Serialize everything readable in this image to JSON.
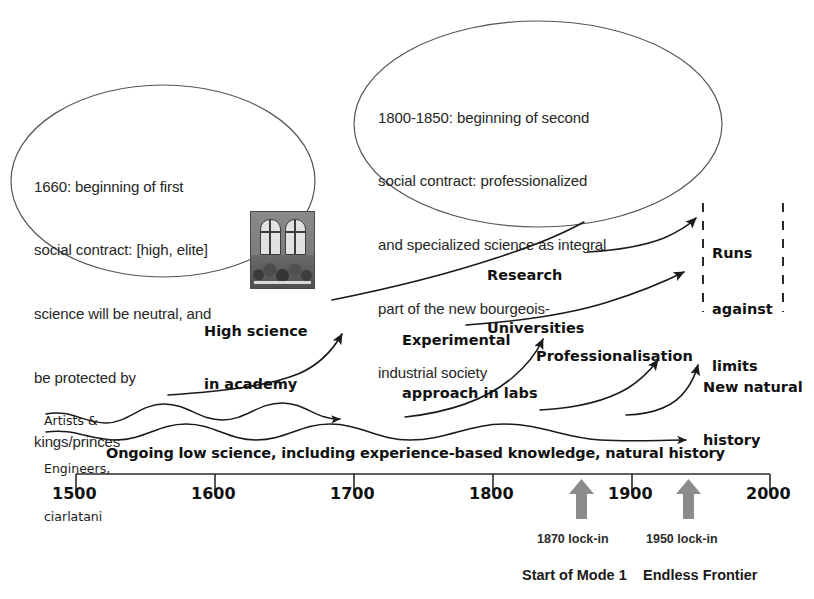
{
  "figure": {
    "type": "diagram"
  },
  "callouts": [
    {
      "id": "first-social-contract",
      "lines": [
        "1660: beginning of first",
        "social contract: [high, elite]",
        "science will be neutral, and",
        "be protected by",
        "kings/princes"
      ]
    },
    {
      "id": "second-social-contract",
      "lines": [
        "1800-1850: beginning of second",
        "social contract: professionalized",
        "and specialized science as integral",
        "part of the new bourgeois-",
        "industrial society"
      ]
    }
  ],
  "labels": {
    "artists": [
      "Artists &",
      "Engineers,",
      "ciarlatani"
    ],
    "high_science": [
      "High science",
      "in academy"
    ],
    "experimental": [
      "Experimental",
      "approach in labs"
    ],
    "research_universities": [
      "Research",
      "Universities"
    ],
    "professionalisation": "Professionalisation",
    "new_natural_history": [
      "New natural",
      "history"
    ],
    "runs_against_limits": [
      "Runs",
      "against",
      "limits"
    ],
    "ongoing_band": "Ongoing low science, including experience-based knowledge, natural history"
  },
  "axis": {
    "start": 1500,
    "end": 2000,
    "step": 100,
    "ticks": [
      "1500",
      "1600",
      "1700",
      "1800",
      "1900",
      "2000"
    ]
  },
  "lock_ins": [
    {
      "year": 1870,
      "marker_label": "1870 lock-in",
      "caption": "Start of Mode 1"
    },
    {
      "year": 1950,
      "marker_label": "1950 lock-in",
      "caption": "Endless Frontier"
    }
  ],
  "image_caption": {
    "name": "academy-engraving",
    "alt": "engraving of an academy interior with two arched windows"
  },
  "colors": {
    "background": "#ffffff",
    "ink": "#111111",
    "ellipse_stroke": "#555555",
    "arrow_stroke": "#1a1a1a",
    "lockin_arrow": "#8c8c8c",
    "dashed_line": "#2a2a2a"
  }
}
